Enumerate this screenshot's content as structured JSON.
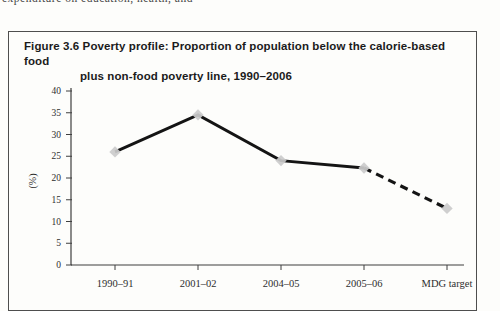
{
  "page": {
    "top_text_fragment": "expenditure on education, health, and"
  },
  "figure": {
    "title_line1": "Figure 3.6 Poverty profile: Proportion of population below the calorie-based food",
    "title_line2": "plus non-food poverty line, 1990–2006"
  },
  "chart_data": {
    "type": "line",
    "title": "Figure 3.6 Poverty profile: Proportion of population below the calorie-based food plus non-food poverty line, 1990–2006",
    "categories": [
      "1990–91",
      "2001–02",
      "2004–05",
      "2005–06",
      "MDG target"
    ],
    "values": [
      26,
      34.5,
      24,
      22.3,
      13
    ],
    "xlabel": "",
    "ylabel": "(%)",
    "ylim": [
      0,
      40
    ],
    "yticks": [
      0,
      5,
      10,
      15,
      20,
      25,
      30,
      35,
      40
    ],
    "grid": false,
    "legend": "none",
    "dash_start_index": 3,
    "marker": "diamond",
    "line_color": "#141414",
    "marker_color": "#cbcbcb",
    "axis_color": "#3f3f3f",
    "tick_label_color": "#2e2e2e"
  }
}
